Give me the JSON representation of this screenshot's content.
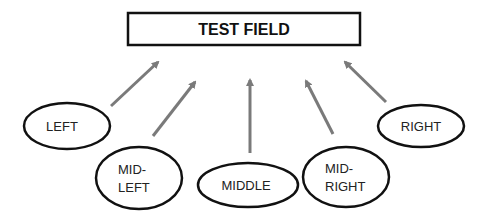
{
  "diagram": {
    "title_box": {
      "label": "TEST FIELD"
    },
    "arrow_color": "#7a7a7a",
    "outline_color": "#111111",
    "nodes": [
      {
        "id": "left",
        "lines": [
          "LEFT"
        ]
      },
      {
        "id": "mid-left",
        "lines": [
          "MID-",
          "LEFT"
        ]
      },
      {
        "id": "middle",
        "lines": [
          "MIDDLE"
        ]
      },
      {
        "id": "mid-right",
        "lines": [
          "MID-",
          "RIGHT"
        ]
      },
      {
        "id": "right",
        "lines": [
          "RIGHT"
        ]
      }
    ],
    "edges": [
      {
        "from": "left",
        "to": "title_box"
      },
      {
        "from": "mid-left",
        "to": "title_box"
      },
      {
        "from": "middle",
        "to": "title_box"
      },
      {
        "from": "mid-right",
        "to": "title_box"
      },
      {
        "from": "right",
        "to": "title_box"
      }
    ]
  }
}
